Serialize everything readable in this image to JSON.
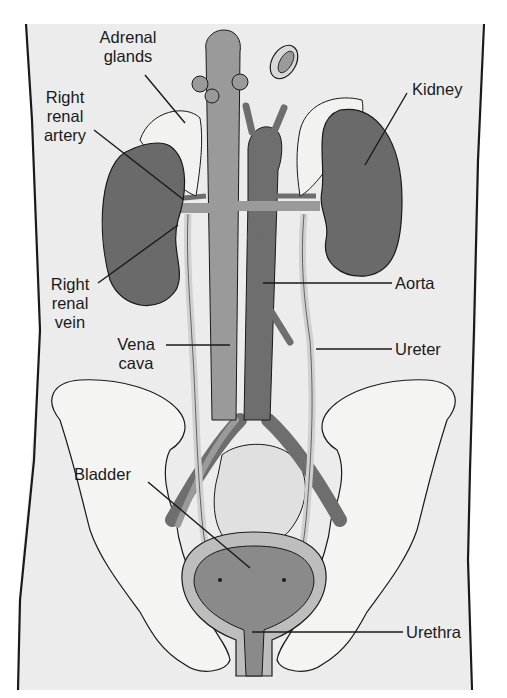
{
  "diagram": {
    "colors": {
      "background": "#ececec",
      "outline": "#1a1a1a",
      "kidney": "#6a6a6a",
      "adrenal": "#f2f2f0",
      "vena_cava": "#9a9a9a",
      "aorta": "#6e6e6e",
      "ureter": "#d0d0d0",
      "pelvis_bone": "#f4f4f2",
      "bladder_inner": "#8a8a8a",
      "bladder_wall": "#bdbdbd",
      "intestine": "#e0e0e0"
    },
    "labels": [
      {
        "id": "adrenal-glands",
        "text": "Adrenal\nglands"
      },
      {
        "id": "right-renal-artery",
        "text": "Right\nrenal\nartery"
      },
      {
        "id": "kidney",
        "text": "Kidney"
      },
      {
        "id": "right-renal-vein",
        "text": "Right\nrenal\nvein"
      },
      {
        "id": "aorta",
        "text": "Aorta"
      },
      {
        "id": "vena-cava",
        "text": "Vena\ncava"
      },
      {
        "id": "ureter",
        "text": "Ureter"
      },
      {
        "id": "bladder",
        "text": "Bladder"
      },
      {
        "id": "urethra",
        "text": "Urethra"
      }
    ]
  }
}
